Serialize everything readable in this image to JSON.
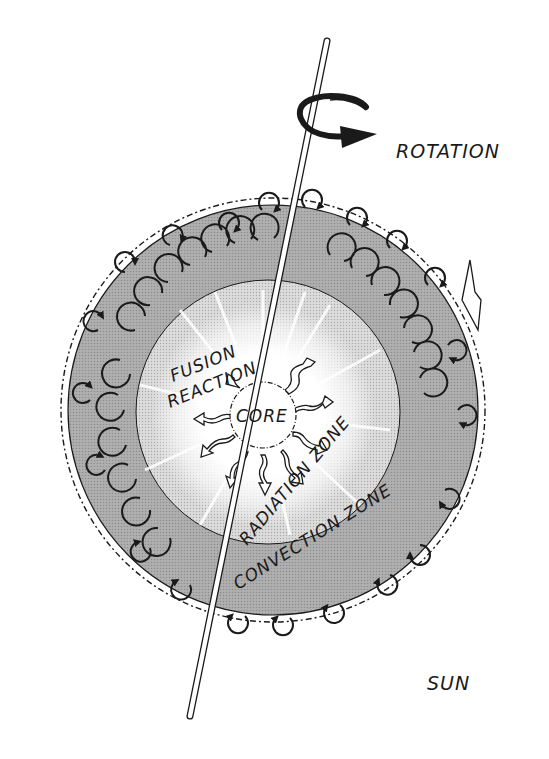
{
  "diagram": {
    "labels": {
      "rotation": "ROTATION",
      "fusion_line1": "FUSION",
      "fusion_line2": "REACTION",
      "core": "CORE",
      "radiation_zone": "RADIATION ZONE",
      "convection_zone": "CONVECTION ZONE",
      "sun": "SUN"
    },
    "layers": [
      {
        "name": "core",
        "label": "CORE"
      },
      {
        "name": "radiation-zone",
        "label": "RADIATION ZONE"
      },
      {
        "name": "convection-zone",
        "label": "CONVECTION ZONE"
      }
    ],
    "colors": {
      "background": "#ffffff",
      "convection_zone": "#a9a9a9",
      "radiation_zone": "#d6d6d6",
      "glow": "#ffffff",
      "ink": "#1a1a1a"
    }
  }
}
